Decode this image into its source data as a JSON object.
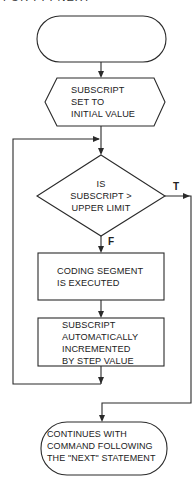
{
  "title": "FOR . . . NEXT",
  "nodes": {
    "start": {
      "type": "terminator",
      "lines": []
    },
    "init": {
      "type": "preparation",
      "lines": [
        "SUBSCRIPT",
        "SET TO",
        "INITIAL VALUE"
      ]
    },
    "decision": {
      "type": "decision",
      "lines": [
        "IS",
        "SUBSCRIPT >",
        "UPPER LIMIT"
      ]
    },
    "execute": {
      "type": "process",
      "lines": [
        "CODING SEGMENT",
        "IS EXECUTED"
      ]
    },
    "increment": {
      "type": "process",
      "lines": [
        "SUBSCRIPT",
        "AUTOMATICALLY",
        "INCREMENTED",
        "BY STEP VALUE"
      ]
    },
    "end": {
      "type": "terminator",
      "lines": [
        "CONTINUES WITH",
        "COMMAND FOLLOWING",
        "THE \"NEXT\" STATEMENT"
      ]
    }
  },
  "edges": {
    "true_label": "T",
    "false_label": "F"
  },
  "colors": {
    "line": "#2a2a2a",
    "background": "#ffffff",
    "text": "#222222"
  }
}
